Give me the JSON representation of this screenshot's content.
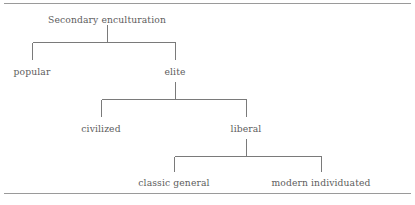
{
  "figure": {
    "type": "tree-diagram",
    "orientation": "top-down",
    "line_color": "#7a7a7a",
    "text_color": "#5d5d5d",
    "rule_color": "#9a9a9a"
  },
  "rules": {
    "top_label": "",
    "bottom_label": ""
  },
  "tree": {
    "root": {
      "label": "Secondary enculturation"
    },
    "level1": [
      {
        "label": "popular"
      },
      {
        "label": "elite"
      }
    ],
    "level2": [
      {
        "label": "civilized"
      },
      {
        "label": "liberal"
      }
    ],
    "level3": [
      {
        "label": "classic general"
      },
      {
        "label": "modern individuated"
      }
    ]
  }
}
